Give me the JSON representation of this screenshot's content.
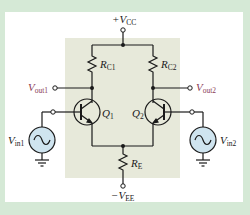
{
  "diagram": {
    "colors": {
      "border": "#d5e9d6",
      "panel": "#ffffff",
      "shaded_region": "#e7e9da",
      "wire": "#1a1a1a",
      "output_label": "#8a3a55",
      "source_fill": "#cfe4ef"
    },
    "labels": {
      "vcc": {
        "prefix": "+",
        "main": "V",
        "sub": "CC"
      },
      "vee": {
        "prefix": "−",
        "main": "V",
        "sub": "EE"
      },
      "rc1": {
        "main": "R",
        "sub": "C1"
      },
      "rc2": {
        "main": "R",
        "sub": "C2"
      },
      "re": {
        "main": "R",
        "sub": "E"
      },
      "q1": {
        "main": "Q",
        "sub": "1"
      },
      "q2": {
        "main": "Q",
        "sub": "2"
      },
      "vout1": {
        "main": "V",
        "sub": "out1"
      },
      "vout2": {
        "main": "V",
        "sub": "out2"
      },
      "vin1": {
        "main": "V",
        "sub": "in1"
      },
      "vin2": {
        "main": "V",
        "sub": "in2"
      }
    },
    "components": [
      {
        "id": "Q1",
        "type": "npn-transistor"
      },
      {
        "id": "Q2",
        "type": "npn-transistor"
      },
      {
        "id": "RC1",
        "type": "resistor"
      },
      {
        "id": "RC2",
        "type": "resistor"
      },
      {
        "id": "RE",
        "type": "resistor"
      },
      {
        "id": "Vin1",
        "type": "ac-voltage-source"
      },
      {
        "id": "Vin2",
        "type": "ac-voltage-source"
      }
    ]
  }
}
